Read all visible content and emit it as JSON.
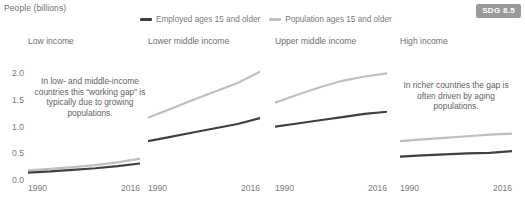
{
  "axis_title": "People (billions)",
  "badge": {
    "label": "SDG 8.5"
  },
  "legend": [
    {
      "label": "Employed ages 15 and older",
      "color": "#404040"
    },
    {
      "label": "Population ages 15 and older",
      "color": "#bfbfbf"
    }
  ],
  "annotations": [
    {
      "text": "In low- and middle-income countries this “working gap” is typically due to growing populations."
    },
    {
      "text": "In richer countries the gap is often driven by aging populations."
    }
  ],
  "chart_data": {
    "type": "line",
    "title": "",
    "xlabel": "",
    "ylabel": "People (billions)",
    "ylim": [
      0,
      2.1
    ],
    "yticks": [
      0.0,
      0.5,
      1.0,
      1.5,
      2.0
    ],
    "ytick_labels": [
      "0.0",
      "0.5",
      "1.0",
      "1.5",
      "2.0"
    ],
    "xlim": [
      1990,
      2016
    ],
    "xticks": [
      1990,
      2016
    ],
    "xtick_labels": [
      "1990",
      "2016"
    ],
    "grid": false,
    "legend_position": "top-center",
    "x": [
      1990,
      1995,
      2000,
      2005,
      2010,
      2016
    ],
    "panels": [
      {
        "title": "Low income",
        "series": [
          {
            "name": "Population ages 15 and older",
            "color": "#bfbfbf",
            "values": [
              0.18,
              0.21,
              0.24,
              0.28,
              0.33,
              0.4
            ]
          },
          {
            "name": "Employed ages 15 and older",
            "color": "#404040",
            "values": [
              0.14,
              0.16,
              0.19,
              0.22,
              0.26,
              0.31
            ]
          }
        ]
      },
      {
        "title": "Lower middle income",
        "series": [
          {
            "name": "Population ages 15 and older",
            "color": "#bfbfbf",
            "values": [
              1.17,
              1.33,
              1.5,
              1.66,
              1.82,
              2.03
            ]
          },
          {
            "name": "Employed ages 15 and older",
            "color": "#404040",
            "values": [
              0.73,
              0.81,
              0.89,
              0.97,
              1.05,
              1.16
            ]
          }
        ]
      },
      {
        "title": "Upper middle income",
        "series": [
          {
            "name": "Population ages 15 and older",
            "color": "#bfbfbf",
            "values": [
              1.45,
              1.6,
              1.74,
              1.86,
              1.94,
              2.0
            ]
          },
          {
            "name": "Employed ages 15 and older",
            "color": "#404040",
            "values": [
              1.0,
              1.06,
              1.12,
              1.18,
              1.24,
              1.28
            ]
          }
        ]
      },
      {
        "title": "High income",
        "series": [
          {
            "name": "Population ages 15 and older",
            "color": "#bfbfbf",
            "values": [
              0.73,
              0.76,
              0.79,
              0.82,
              0.85,
              0.87
            ]
          },
          {
            "name": "Employed ages 15 and older",
            "color": "#404040",
            "values": [
              0.44,
              0.46,
              0.48,
              0.5,
              0.51,
              0.54
            ]
          }
        ]
      }
    ]
  }
}
